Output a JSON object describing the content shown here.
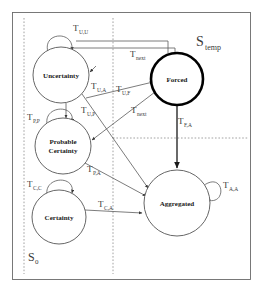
{
  "figure": {
    "background_color": "#ffffff",
    "frame_color": "#6a6a6a",
    "edge_color": "#5a5a5a",
    "accent_color": "#000000",
    "divider_color": "#8a8a8a"
  },
  "regions": [
    {
      "id": "s-temp",
      "label": "S",
      "subscript": "temp"
    },
    {
      "id": "s-zero",
      "label": "S",
      "subscript": "0"
    }
  ],
  "states": [
    {
      "id": "uncertainty",
      "label": "Uncertainty",
      "cx": 61,
      "cy": 75,
      "r": 28,
      "emphasis": "normal"
    },
    {
      "id": "probable-certainty",
      "label_line1": "Probable",
      "label_line2": "Certainty",
      "cx": 63,
      "cy": 146,
      "r": 28,
      "emphasis": "normal"
    },
    {
      "id": "certainty",
      "label": "Certainty",
      "cx": 59,
      "cy": 217,
      "r": 27,
      "emphasis": "normal"
    },
    {
      "id": "forced",
      "label": "Forced",
      "cx": 177,
      "cy": 79,
      "r": 26,
      "emphasis": "bold"
    },
    {
      "id": "aggregated",
      "label": "Aggregated",
      "cx": 177,
      "cy": 203,
      "r": 33,
      "emphasis": "normal"
    }
  ],
  "transitions": [
    {
      "id": "t-uu",
      "label": "T",
      "subscript": "U,U",
      "from": "uncertainty",
      "to": "uncertainty",
      "kind": "self-loop",
      "x": 73,
      "y": 31
    },
    {
      "id": "t-next-top",
      "label": "T",
      "subscript": "next",
      "from": "uncertainty",
      "to": "forced",
      "kind": "edge",
      "x": 130,
      "y": 57
    },
    {
      "id": "t-ua",
      "label": "T",
      "subscript": "U,A",
      "from": "uncertainty",
      "to": "aggregated",
      "kind": "edge",
      "x": 91,
      "y": 89
    },
    {
      "id": "t-uf",
      "label": "T",
      "subscript": "U,F",
      "from": "uncertainty",
      "to": "forced",
      "kind": "edge",
      "x": 116,
      "y": 92
    },
    {
      "id": "t-up",
      "label": "T",
      "subscript": "U,P",
      "from": "uncertainty",
      "to": "probable-certainty",
      "kind": "edge",
      "x": 81,
      "y": 113
    },
    {
      "id": "t-pp",
      "label": "T",
      "subscript": "P,P",
      "from": "probable-certainty",
      "to": "probable-certainty",
      "kind": "self-loop",
      "x": 27,
      "y": 120
    },
    {
      "id": "t-next-mid",
      "label": "T",
      "subscript": "next",
      "from": "forced",
      "to": "probable-certainty",
      "kind": "edge",
      "x": 131,
      "y": 113
    },
    {
      "id": "t-fa",
      "label": "T",
      "subscript": "F,A",
      "from": "forced",
      "to": "aggregated",
      "kind": "edge",
      "x": 178,
      "y": 124
    },
    {
      "id": "t-pa",
      "label": "T",
      "subscript": "P,A",
      "from": "probable-certainty",
      "to": "aggregated",
      "kind": "edge",
      "x": 87,
      "y": 172
    },
    {
      "id": "t-cc",
      "label": "T",
      "subscript": "C,C",
      "from": "certainty",
      "to": "certainty",
      "kind": "self-loop",
      "x": 27,
      "y": 187
    },
    {
      "id": "t-ca",
      "label": "T",
      "subscript": "C,A",
      "from": "certainty",
      "to": "aggregated",
      "kind": "edge",
      "x": 98,
      "y": 207
    },
    {
      "id": "t-aa",
      "label": "T",
      "subscript": "A,A",
      "from": "aggregated",
      "to": "aggregated",
      "kind": "self-loop",
      "x": 223,
      "y": 188
    }
  ]
}
